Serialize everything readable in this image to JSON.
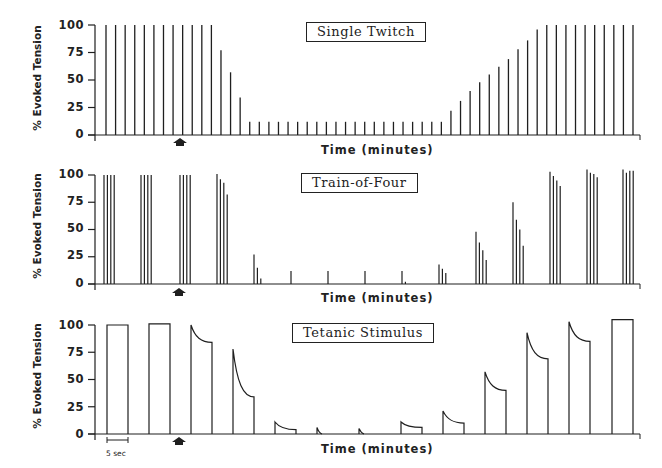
{
  "colors": {
    "ink": "#1f1f1f",
    "background": "#ffffff"
  },
  "chart_data": [
    {
      "type": "bar",
      "title": "Single Twitch",
      "xlabel": "Time (minutes)",
      "ylabel": "% Evoked Tension",
      "yticks": [
        0,
        25,
        50,
        75,
        100
      ],
      "ylim": [
        0,
        100
      ],
      "grid": false,
      "annotation": "arrow marking drug administration at ~8th stimulus",
      "values": [
        100,
        100,
        100,
        100,
        100,
        100,
        100,
        100,
        100,
        100,
        100,
        100,
        77,
        57,
        34,
        12,
        12,
        12,
        12,
        12,
        12,
        12,
        12,
        12,
        12,
        12,
        12,
        12,
        12,
        12,
        12,
        12,
        12,
        12,
        12,
        12,
        22,
        31,
        40,
        48,
        55,
        62,
        69,
        78,
        86,
        96,
        100,
        100,
        100,
        100,
        100,
        100,
        100,
        100,
        100,
        100
      ]
    },
    {
      "type": "bar",
      "title": "Train-of-Four",
      "xlabel": "Time (minutes)",
      "ylabel": "% Evoked Tension",
      "yticks": [
        0,
        25,
        50,
        75,
        100
      ],
      "ylim": [
        0,
        100
      ],
      "grid": false,
      "annotation": "arrow marking drug administration at 3rd train",
      "trains": [
        [
          100,
          100,
          100,
          100
        ],
        [
          100,
          100,
          100,
          100
        ],
        [
          100,
          100,
          100,
          100
        ],
        [
          101,
          96,
          93,
          82
        ],
        [
          27,
          15,
          5,
          0
        ],
        [
          12,
          0,
          0,
          0
        ],
        [
          12,
          0,
          0,
          0
        ],
        [
          12,
          0,
          0,
          0
        ],
        [
          12,
          2,
          0,
          0
        ],
        [
          18,
          14,
          10,
          0
        ],
        [
          48,
          38,
          31,
          22
        ],
        [
          75,
          59,
          50,
          35
        ],
        [
          103,
          99,
          95,
          90
        ],
        [
          105,
          102,
          101,
          98
        ],
        [
          105,
          102,
          104,
          104
        ]
      ]
    },
    {
      "type": "line",
      "title": "Tetanic Stimulus",
      "xlabel": "Time (minutes)",
      "ylabel": "% Evoked Tension",
      "yticks": [
        0,
        25,
        50,
        75,
        100
      ],
      "ylim": [
        0,
        100
      ],
      "grid": false,
      "scale_bar": "5 sec",
      "annotation": "arrow marking drug administration after 2nd tetanus",
      "tetani": [
        {
          "peak": 100,
          "end": 100
        },
        {
          "peak": 101,
          "end": 101
        },
        {
          "peak": 100,
          "end": 84
        },
        {
          "peak": 78,
          "end": 34
        },
        {
          "peak": 11,
          "end": 4
        },
        {
          "peak": 6,
          "end": 0
        },
        {
          "peak": 5,
          "end": 0
        },
        {
          "peak": 11,
          "end": 6
        },
        {
          "peak": 21,
          "end": 10
        },
        {
          "peak": 57,
          "end": 40
        },
        {
          "peak": 93,
          "end": 69
        },
        {
          "peak": 103,
          "end": 85
        },
        {
          "peak": 105,
          "end": 105
        }
      ]
    }
  ],
  "panels": [
    {
      "title": "Single Twitch",
      "xlabel": "Time (minutes)",
      "ylabel": "% Evoked Tension"
    },
    {
      "title": "Train-of-Four",
      "xlabel": "Time (minutes)",
      "ylabel": "% Evoked Tension"
    },
    {
      "title": "Tetanic Stimulus",
      "xlabel": "Time (minutes)",
      "ylabel": "% Evoked Tension"
    }
  ],
  "ytick_labels": [
    "100",
    "75",
    "50",
    "25",
    "0"
  ],
  "scale_bar_label": "5 sec"
}
